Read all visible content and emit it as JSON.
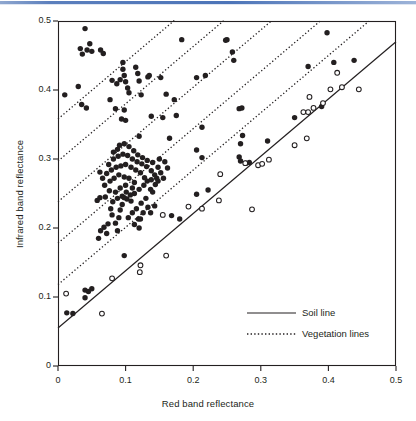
{
  "figure": {
    "name": "soil-line-vegetation-scatter",
    "background": "#ffffff",
    "top_rule_color": "#4c74b8"
  },
  "axes": {
    "x_label": "Red band reflectance",
    "y_label": "Infrared band reflectance",
    "x_ticks": [
      "0",
      "0.1",
      "0.2",
      "0.3",
      "0.4",
      "0.5"
    ],
    "y_ticks": [
      "0",
      "0.1",
      "0.2",
      "0.3",
      "0.4",
      "0.5"
    ],
    "x_tick_values": [
      0,
      0.1,
      0.2,
      0.3,
      0.4,
      0.5
    ],
    "y_tick_values": [
      0,
      0.1,
      0.2,
      0.3,
      0.4,
      0.5
    ],
    "xlim": [
      0,
      0.5
    ],
    "ylim": [
      0,
      0.5
    ],
    "frame_color": "#231f20"
  },
  "legend": {
    "position": "bottom-right",
    "items": [
      {
        "label": "Soil line",
        "style": "solid",
        "color": "#231f20"
      },
      {
        "label": "Vegetation lines",
        "style": "dotted",
        "color": "#231f20"
      }
    ]
  },
  "chart_data": {
    "type": "scatter",
    "title": "",
    "xlabel": "Red band reflectance",
    "ylabel": "Infrared band reflectance",
    "xlim": [
      0,
      0.5
    ],
    "ylim": [
      0,
      0.5
    ],
    "grid": false,
    "legend_position": "bottom-right",
    "series": [
      {
        "name": "Filled markers",
        "marker": "filled-circle",
        "color": "#231f20",
        "points": [
          [
            0.01,
            0.393
          ],
          [
            0.04,
            0.489
          ],
          [
            0.047,
            0.467
          ],
          [
            0.033,
            0.46
          ],
          [
            0.043,
            0.458
          ],
          [
            0.05,
            0.456
          ],
          [
            0.063,
            0.458
          ],
          [
            0.067,
            0.453
          ],
          [
            0.036,
            0.452
          ],
          [
            0.03,
            0.405
          ],
          [
            0.035,
            0.379
          ],
          [
            0.042,
            0.374
          ],
          [
            0.096,
            0.44
          ],
          [
            0.096,
            0.43
          ],
          [
            0.098,
            0.421
          ],
          [
            0.092,
            0.415
          ],
          [
            0.1,
            0.412
          ],
          [
            0.103,
            0.403
          ],
          [
            0.105,
            0.396
          ],
          [
            0.087,
            0.409
          ],
          [
            0.08,
            0.414
          ],
          [
            0.077,
            0.386
          ],
          [
            0.085,
            0.373
          ],
          [
            0.098,
            0.371
          ],
          [
            0.094,
            0.358
          ],
          [
            0.1,
            0.356
          ],
          [
            0.118,
            0.424
          ],
          [
            0.115,
            0.433
          ],
          [
            0.12,
            0.413
          ],
          [
            0.123,
            0.393
          ],
          [
            0.133,
            0.419
          ],
          [
            0.135,
            0.421
          ],
          [
            0.152,
            0.418
          ],
          [
            0.16,
            0.394
          ],
          [
            0.138,
            0.362
          ],
          [
            0.155,
            0.36
          ],
          [
            0.172,
            0.386
          ],
          [
            0.175,
            0.363
          ],
          [
            0.183,
            0.473
          ],
          [
            0.12,
            0.333
          ],
          [
            0.165,
            0.33
          ],
          [
            0.25,
            0.473
          ],
          [
            0.205,
            0.418
          ],
          [
            0.218,
            0.421
          ],
          [
            0.213,
            0.346
          ],
          [
            0.205,
            0.313
          ],
          [
            0.213,
            0.302
          ],
          [
            0.248,
            0.472
          ],
          [
            0.258,
            0.455
          ],
          [
            0.26,
            0.443
          ],
          [
            0.272,
            0.374
          ],
          [
            0.268,
            0.373
          ],
          [
            0.273,
            0.334
          ],
          [
            0.27,
            0.322
          ],
          [
            0.268,
            0.303
          ],
          [
            0.27,
            0.297
          ],
          [
            0.278,
            0.294
          ],
          [
            0.283,
            0.295
          ],
          [
            0.31,
            0.326
          ],
          [
            0.35,
            0.36
          ],
          [
            0.37,
            0.434
          ],
          [
            0.39,
            0.376
          ],
          [
            0.398,
            0.483
          ],
          [
            0.408,
            0.44
          ],
          [
            0.438,
            0.443
          ],
          [
            0.12,
            0.2
          ],
          [
            0.098,
            0.16
          ],
          [
            0.04,
            0.11
          ],
          [
            0.045,
            0.108
          ],
          [
            0.05,
            0.112
          ],
          [
            0.04,
            0.099
          ],
          [
            0.013,
            0.077
          ],
          [
            0.022,
            0.076
          ],
          [
            0.18,
            0.213
          ],
          [
            0.205,
            0.249
          ],
          [
            0.222,
            0.255
          ],
          [
            0.168,
            0.218
          ],
          [
            0.07,
            0.245
          ],
          [
            0.058,
            0.24
          ],
          [
            0.062,
            0.244
          ],
          [
            0.078,
            0.228
          ],
          [
            0.08,
            0.219
          ],
          [
            0.074,
            0.206
          ],
          [
            0.068,
            0.201
          ],
          [
            0.063,
            0.196
          ],
          [
            0.06,
            0.185
          ],
          [
            0.072,
            0.192
          ],
          [
            0.085,
            0.207
          ],
          [
            0.09,
            0.215
          ],
          [
            0.088,
            0.196
          ],
          [
            0.092,
            0.226
          ],
          [
            0.095,
            0.234
          ],
          [
            0.102,
            0.242
          ],
          [
            0.108,
            0.239
          ],
          [
            0.085,
            0.252
          ],
          [
            0.092,
            0.258
          ],
          [
            0.1,
            0.262
          ],
          [
            0.11,
            0.258
          ],
          [
            0.113,
            0.266
          ],
          [
            0.105,
            0.272
          ],
          [
            0.098,
            0.274
          ],
          [
            0.09,
            0.277
          ],
          [
            0.083,
            0.272
          ],
          [
            0.077,
            0.268
          ],
          [
            0.072,
            0.279
          ],
          [
            0.079,
            0.284
          ],
          [
            0.086,
            0.288
          ],
          [
            0.093,
            0.29
          ],
          [
            0.1,
            0.292
          ],
          [
            0.108,
            0.288
          ],
          [
            0.115,
            0.284
          ],
          [
            0.122,
            0.28
          ],
          [
            0.128,
            0.273
          ],
          [
            0.132,
            0.268
          ],
          [
            0.127,
            0.262
          ],
          [
            0.12,
            0.256
          ],
          [
            0.113,
            0.25
          ],
          [
            0.107,
            0.248
          ],
          [
            0.101,
            0.252
          ],
          [
            0.095,
            0.246
          ],
          [
            0.088,
            0.243
          ],
          [
            0.081,
            0.238
          ],
          [
            0.076,
            0.254
          ],
          [
            0.069,
            0.262
          ],
          [
            0.075,
            0.292
          ],
          [
            0.082,
            0.3
          ],
          [
            0.089,
            0.304
          ],
          [
            0.096,
            0.307
          ],
          [
            0.103,
            0.305
          ],
          [
            0.11,
            0.3
          ],
          [
            0.117,
            0.296
          ],
          [
            0.124,
            0.293
          ],
          [
            0.131,
            0.289
          ],
          [
            0.138,
            0.283
          ],
          [
            0.143,
            0.277
          ],
          [
            0.138,
            0.27
          ],
          [
            0.144,
            0.263
          ],
          [
            0.137,
            0.256
          ],
          [
            0.13,
            0.243
          ],
          [
            0.123,
            0.236
          ],
          [
            0.116,
            0.228
          ],
          [
            0.11,
            0.222
          ],
          [
            0.104,
            0.215
          ],
          [
            0.098,
            0.244
          ],
          [
            0.091,
            0.32
          ],
          [
            0.098,
            0.322
          ],
          [
            0.105,
            0.318
          ],
          [
            0.088,
            0.314
          ],
          [
            0.082,
            0.31
          ],
          [
            0.112,
            0.312
          ],
          [
            0.118,
            0.306
          ],
          [
            0.125,
            0.302
          ],
          [
            0.132,
            0.298
          ],
          [
            0.14,
            0.295
          ],
          [
            0.148,
            0.288
          ],
          [
            0.152,
            0.28
          ],
          [
            0.146,
            0.272
          ],
          [
            0.14,
            0.252
          ],
          [
            0.133,
            0.23
          ],
          [
            0.126,
            0.222
          ],
          [
            0.119,
            0.213
          ],
          [
            0.113,
            0.205
          ],
          [
            0.066,
            0.272
          ],
          [
            0.062,
            0.281
          ],
          [
            0.148,
            0.268
          ],
          [
            0.156,
            0.272
          ],
          [
            0.162,
            0.287
          ],
          [
            0.158,
            0.296
          ],
          [
            0.15,
            0.3
          ],
          [
            0.143,
            0.232
          ],
          [
            0.137,
            0.222
          ],
          [
            0.122,
            0.213
          ]
        ]
      },
      {
        "name": "Open markers",
        "marker": "open-circle",
        "color": "#231f20",
        "points": [
          [
            0.012,
            0.105
          ],
          [
            0.065,
            0.076
          ],
          [
            0.08,
            0.127
          ],
          [
            0.122,
            0.146
          ],
          [
            0.121,
            0.136
          ],
          [
            0.155,
            0.219
          ],
          [
            0.16,
            0.16
          ],
          [
            0.193,
            0.231
          ],
          [
            0.213,
            0.228
          ],
          [
            0.238,
            0.24
          ],
          [
            0.24,
            0.278
          ],
          [
            0.287,
            0.227
          ],
          [
            0.277,
            0.294
          ],
          [
            0.296,
            0.291
          ],
          [
            0.302,
            0.293
          ],
          [
            0.312,
            0.299
          ],
          [
            0.35,
            0.32
          ],
          [
            0.363,
            0.368
          ],
          [
            0.37,
            0.368
          ],
          [
            0.372,
            0.39
          ],
          [
            0.378,
            0.374
          ],
          [
            0.392,
            0.381
          ],
          [
            0.403,
            0.401
          ],
          [
            0.413,
            0.425
          ],
          [
            0.42,
            0.404
          ],
          [
            0.445,
            0.401
          ],
          [
            0.368,
            0.33
          ]
        ]
      }
    ],
    "lines": [
      {
        "name": "Soil line",
        "style": "solid",
        "slope": 0.83,
        "intercept": 0.055,
        "x_from": 0.0,
        "x_to": 0.5
      },
      {
        "name": "Vegetation line 1",
        "style": "dotted",
        "slope": 0.83,
        "intercept": 0.118,
        "x_from": 0.0,
        "x_to": 0.46
      },
      {
        "name": "Vegetation line 2",
        "style": "dotted",
        "slope": 0.83,
        "intercept": 0.178,
        "x_from": 0.0,
        "x_to": 0.39
      },
      {
        "name": "Vegetation line 3",
        "style": "dotted",
        "slope": 0.83,
        "intercept": 0.238,
        "x_from": 0.0,
        "x_to": 0.315
      },
      {
        "name": "Vegetation line 4",
        "style": "dotted",
        "slope": 0.83,
        "intercept": 0.297,
        "x_from": 0.0,
        "x_to": 0.245
      },
      {
        "name": "Vegetation line 5",
        "style": "dotted",
        "slope": 0.83,
        "intercept": 0.358,
        "x_from": 0.0,
        "x_to": 0.172
      }
    ]
  }
}
